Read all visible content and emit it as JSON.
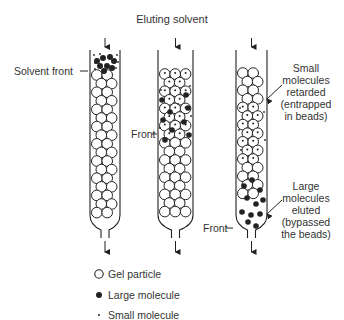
{
  "diagram": {
    "title": "Eluting solvent",
    "labels": {
      "solvent_front": "Solvent front",
      "front_col2": "Front",
      "front_col3": "Front",
      "small_retarded": [
        "Small",
        "molecules",
        "retarded",
        "(entrapped",
        "in beads)"
      ],
      "large_eluted": [
        "Large",
        "molecules",
        "eluted",
        "(bypassed",
        "the beads)"
      ]
    },
    "columns": [
      {
        "id": 1,
        "stage": "sample applied at top"
      },
      {
        "id": 2,
        "stage": "separation in progress"
      },
      {
        "id": 3,
        "stage": "large molecules eluting"
      }
    ],
    "legend": [
      {
        "symbol": "open-circle",
        "label": "Gel particle"
      },
      {
        "symbol": "filled-dot",
        "label": "Large molecule"
      },
      {
        "symbol": "small-dot",
        "label": "Small molecule"
      }
    ],
    "colors": {
      "ink": "#222222",
      "background": "#ffffff"
    }
  }
}
